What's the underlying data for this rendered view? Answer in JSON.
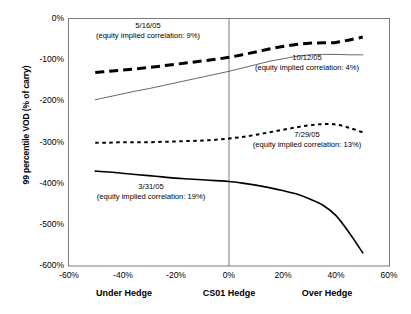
{
  "chart_data": {
    "type": "line",
    "title": "",
    "xlabel": "",
    "ylabel": "99 percentile VOD (% of carry)",
    "xlim": [
      -60,
      60
    ],
    "ylim": [
      -600,
      0
    ],
    "grid": false,
    "legend": "none (inline annotations)",
    "x_ticks": [
      "-60%",
      "-40%",
      "-20%",
      "0%",
      "20%",
      "40%",
      "60%"
    ],
    "x_tick_values": [
      -60,
      -40,
      -20,
      0,
      20,
      40,
      60
    ],
    "y_ticks": [
      "0%",
      "-100%",
      "-200%",
      "-300%",
      "-400%",
      "-500%",
      "-600%"
    ],
    "y_tick_values": [
      0,
      -100,
      -200,
      -300,
      -400,
      -500,
      -600
    ],
    "x_group_labels": [
      "Under Hedge",
      "CS01 Hedge",
      "Over Hedge"
    ],
    "x_group_positions": [
      -40,
      0,
      37
    ],
    "reference_line_x": 0,
    "series": [
      {
        "name": "5/16/05",
        "style": "thick-dashed",
        "color": "#000000",
        "equity_implied_correlation": "9%",
        "x": [
          -50,
          -45,
          -40,
          -35,
          -30,
          -25,
          -20,
          -15,
          -10,
          -5,
          0,
          5,
          10,
          15,
          20,
          25,
          30,
          35,
          40,
          45,
          50
        ],
        "values": [
          -131,
          -128,
          -125,
          -122,
          -119,
          -115,
          -111,
          -107,
          -103,
          -99,
          -94,
          -88,
          -81,
          -74,
          -68,
          -63,
          -60,
          -59,
          -58,
          -52,
          -45
        ]
      },
      {
        "name": "10/12/05",
        "style": "thin-solid",
        "color": "#555555",
        "equity_implied_correlation": "4%",
        "x": [
          -50,
          -45,
          -40,
          -35,
          -30,
          -25,
          -20,
          -15,
          -10,
          -5,
          0,
          5,
          10,
          15,
          20,
          25,
          30,
          35,
          40,
          45,
          50
        ],
        "values": [
          -197,
          -190,
          -183,
          -176,
          -170,
          -163,
          -156,
          -149,
          -142,
          -135,
          -128,
          -120,
          -112,
          -104,
          -98,
          -92,
          -88,
          -87,
          -87,
          -88,
          -88
        ]
      },
      {
        "name": "7/29/05",
        "style": "fine-dotted",
        "color": "#000000",
        "equity_implied_correlation": "13%",
        "x": [
          -50,
          -45,
          -40,
          -35,
          -30,
          -25,
          -20,
          -15,
          -10,
          -5,
          0,
          5,
          10,
          15,
          20,
          25,
          30,
          35,
          40,
          45,
          50
        ],
        "values": [
          -301,
          -301,
          -300,
          -300,
          -300,
          -299,
          -298,
          -297,
          -296,
          -294,
          -291,
          -287,
          -282,
          -276,
          -270,
          -264,
          -259,
          -256,
          -257,
          -265,
          -276
        ]
      },
      {
        "name": "3/31/05",
        "style": "medium-solid",
        "color": "#000000",
        "equity_implied_correlation": "19%",
        "x": [
          -50,
          -45,
          -40,
          -35,
          -30,
          -25,
          -20,
          -15,
          -10,
          -5,
          0,
          5,
          10,
          15,
          20,
          25,
          30,
          35,
          40,
          45,
          50
        ],
        "values": [
          -370,
          -372,
          -375,
          -378,
          -381,
          -384,
          -387,
          -389,
          -391,
          -393,
          -395,
          -399,
          -404,
          -410,
          -417,
          -425,
          -437,
          -452,
          -478,
          -520,
          -568
        ]
      }
    ],
    "annotations": [
      {
        "id": "annotation-5-16-05",
        "line1": "5/16/05",
        "line2": "(equity implied correlation: 9%)",
        "x_px": 148,
        "y_px": 21
      },
      {
        "id": "annotation-10-12-05",
        "line1": "10/12/05",
        "line2": "(equity implied correlation: 4%)",
        "x_px": 307,
        "y_px": 53
      },
      {
        "id": "annotation-7-29-05",
        "line1": "7/29/05",
        "line2": "(equity implied correlation: 13%)",
        "x_px": 307,
        "y_px": 130
      },
      {
        "id": "annotation-3-31-05",
        "line1": "3/31/05",
        "line2": "(equity implied correlation: 19%)",
        "x_px": 151,
        "y_px": 182
      }
    ]
  }
}
